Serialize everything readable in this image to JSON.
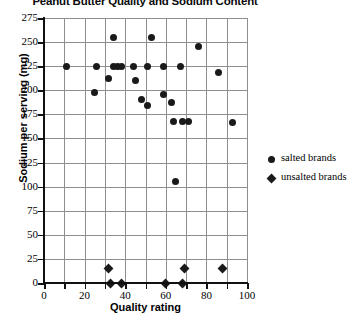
{
  "chart_data": {
    "type": "scatter",
    "title": "Peanut Butter Quality and Sodium Content",
    "xlabel": "Quality rating",
    "ylabel": "Sodium per serving (mg)",
    "xlim": [
      0,
      100
    ],
    "ylim": [
      0,
      275
    ],
    "xticks": [
      0,
      20,
      40,
      60,
      80,
      100
    ],
    "xtick_labels": [
      "0",
      "20",
      "40",
      "60",
      "80",
      "100"
    ],
    "xminor_step": 10,
    "yticks": [
      0,
      25,
      50,
      75,
      100,
      125,
      150,
      175,
      200,
      225,
      250,
      275
    ],
    "ytick_labels": [
      "0",
      "25",
      "50",
      "75",
      "100",
      "125",
      "150",
      "175",
      "200",
      "225",
      "250",
      "275"
    ],
    "grid": true,
    "legend_position": "right",
    "series": [
      {
        "name": "salted brands",
        "marker": "circle",
        "color": "#1a1a1a",
        "points": [
          [
            11,
            225
          ],
          [
            26,
            225
          ],
          [
            34,
            225
          ],
          [
            36,
            225
          ],
          [
            38,
            225
          ],
          [
            44,
            225
          ],
          [
            51,
            225
          ],
          [
            59,
            225
          ],
          [
            67,
            225
          ],
          [
            34,
            255
          ],
          [
            53,
            255
          ],
          [
            76,
            245
          ],
          [
            32,
            212
          ],
          [
            25,
            198
          ],
          [
            45,
            210
          ],
          [
            48,
            190
          ],
          [
            51,
            184
          ],
          [
            59,
            196
          ],
          [
            63,
            187
          ],
          [
            86,
            218
          ],
          [
            93,
            167
          ],
          [
            64,
            168
          ],
          [
            68,
            168
          ],
          [
            71,
            168
          ],
          [
            65,
            105
          ]
        ]
      },
      {
        "name": "unsalted brands",
        "marker": "diamond",
        "color": "#1a1a1a",
        "points": [
          [
            32,
            15
          ],
          [
            33,
            0
          ],
          [
            38,
            0
          ],
          [
            60,
            0
          ],
          [
            68,
            0
          ],
          [
            69,
            15
          ],
          [
            88,
            15
          ]
        ]
      }
    ]
  },
  "legend": {
    "items": [
      {
        "label": "salted brands",
        "marker": "circle"
      },
      {
        "label": "unsalted brands",
        "marker": "diamond"
      }
    ]
  }
}
